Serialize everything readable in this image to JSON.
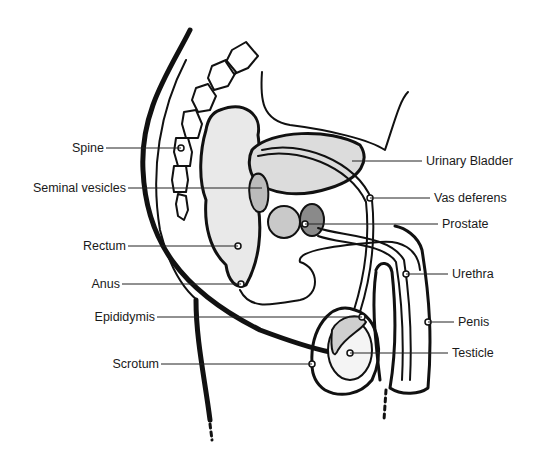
{
  "diagram": {
    "colors": {
      "ink": "#111111",
      "background": "#ffffff",
      "label": "#1a1a1a"
    },
    "labels_left": [
      {
        "id": "spine",
        "text": "Spine",
        "x": 104,
        "y": 147,
        "line_to": [
          181,
          148
        ]
      },
      {
        "id": "seminal-vesicles",
        "text": "Seminal vesicles",
        "x": 126,
        "y": 187,
        "line_to": [
          262,
          188
        ]
      },
      {
        "id": "rectum",
        "text": "Rectum",
        "x": 126,
        "y": 244,
        "line_to": [
          238,
          246
        ]
      },
      {
        "id": "anus",
        "text": "Anus",
        "x": 120,
        "y": 283,
        "line_to": [
          241,
          284
        ]
      },
      {
        "id": "epididymis",
        "text": "Epididymis",
        "x": 155,
        "y": 316,
        "line_to": [
          362,
          317
        ]
      },
      {
        "id": "scrotum",
        "text": "Scrotum",
        "x": 159,
        "y": 363,
        "line_to": [
          312,
          364
        ]
      }
    ],
    "labels_right": [
      {
        "id": "urinary-bladder",
        "text": "Urinary Bladder",
        "x": 426,
        "y": 161,
        "line_from": [
          352,
          161
        ]
      },
      {
        "id": "vas-deferens",
        "text": "Vas deferens",
        "x": 434,
        "y": 197,
        "line_from": [
          370,
          198
        ]
      },
      {
        "id": "prostate",
        "text": "Prostate",
        "x": 442,
        "y": 224,
        "line_from": [
          305,
          224
        ]
      },
      {
        "id": "urethra",
        "text": "Urethra",
        "x": 452,
        "y": 274,
        "line_from": [
          406,
          274
        ]
      },
      {
        "id": "penis",
        "text": "Penis",
        "x": 458,
        "y": 322,
        "line_from": [
          428,
          322
        ]
      },
      {
        "id": "testicle",
        "text": "Testicle",
        "x": 452,
        "y": 353,
        "line_from": [
          350,
          353
        ]
      }
    ]
  }
}
